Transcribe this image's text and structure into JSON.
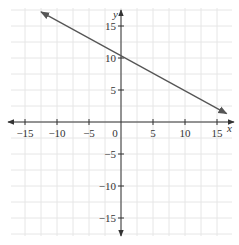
{
  "chart_data": {
    "type": "line",
    "title": "",
    "xlabel": "x",
    "ylabel": "y",
    "xlim": [
      -17.3,
      17.3
    ],
    "ylim": [
      -17.8,
      17.8
    ],
    "grid": true,
    "grid_step": 2.5,
    "x_ticks": [
      -15,
      -10,
      -5,
      0,
      5,
      10,
      15
    ],
    "y_ticks": [
      -15,
      -10,
      -5,
      5,
      10,
      15
    ],
    "x_tick_labels": [
      "−15",
      "−10",
      "−5",
      "0",
      "5",
      "10",
      "15"
    ],
    "y_tick_labels": [
      "−15",
      "−10",
      "−5",
      "5",
      "10",
      "15"
    ],
    "series": [
      {
        "name": "line",
        "description": "Straight line with arrows at both ends, y-intercept 10, negative slope",
        "x": [
          -12.5,
          0,
          16.5
        ],
        "y": [
          17.2,
          10,
          1.3
        ],
        "color": "#555555"
      }
    ]
  },
  "labels": {
    "x_axis": "x",
    "y_axis": "y",
    "origin": "0"
  },
  "colors": {
    "grid": "#e6e6e6",
    "axis": "#333333",
    "line": "#555555"
  }
}
